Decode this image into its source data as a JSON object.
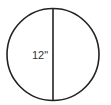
{
  "diagram": {
    "shape": "circle",
    "stroke_color": "#222222",
    "circle": {
      "cx": 53,
      "cy": 54.5,
      "r": 46
    },
    "diameter_line": {
      "x": 53,
      "y1": 8.5,
      "y2": 100.5,
      "orientation": "vertical"
    },
    "dimension_label": "12\"",
    "label_color": "#333333"
  }
}
